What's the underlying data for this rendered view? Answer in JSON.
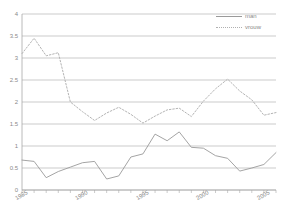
{
  "chart_data": {
    "type": "line",
    "title": "",
    "xlabel": "",
    "ylabel": "",
    "ylim": [
      0,
      4
    ],
    "xlim": [
      1985,
      2006
    ],
    "grid": true,
    "legend_position": "top-right",
    "ytick_labels": [
      "0",
      "0.5",
      "1",
      "1.5",
      "2",
      "2.5",
      "3",
      "3.5",
      "4"
    ],
    "ytick_values": [
      0,
      0.5,
      1,
      1.5,
      2,
      2.5,
      3,
      3.5,
      4
    ],
    "xtick_labels": [
      "1985",
      "1990",
      "1995",
      "2000",
      "2005"
    ],
    "xtick_values": [
      1985,
      1990,
      1995,
      2000,
      2005
    ],
    "x": [
      1985,
      1986,
      1987,
      1988,
      1989,
      1990,
      1991,
      1992,
      1993,
      1994,
      1995,
      1996,
      1997,
      1998,
      1999,
      2000,
      2001,
      2002,
      2003,
      2004,
      2005,
      2006
    ],
    "series": [
      {
        "name": "man",
        "style": "solid",
        "color": "#9a9a9a",
        "values": [
          0.68,
          0.65,
          0.28,
          0.42,
          0.52,
          0.62,
          0.65,
          0.25,
          0.32,
          0.75,
          0.82,
          1.27,
          1.12,
          1.32,
          0.97,
          0.95,
          0.78,
          0.72,
          0.43,
          0.5,
          0.58,
          0.85
        ]
      },
      {
        "name": "vrouw",
        "style": "dotted",
        "color": "#b4b4b4",
        "values": [
          3.1,
          3.45,
          3.05,
          3.12,
          2.0,
          1.78,
          1.58,
          1.75,
          1.88,
          1.72,
          1.52,
          1.68,
          1.82,
          1.86,
          1.67,
          2.02,
          2.3,
          2.52,
          2.25,
          2.05,
          1.7,
          1.76
        ]
      }
    ]
  },
  "legend": {
    "entries": [
      {
        "label": "man",
        "key": "solid-line-key"
      },
      {
        "label": "vrouw",
        "key": "dotted-line-key"
      }
    ]
  }
}
